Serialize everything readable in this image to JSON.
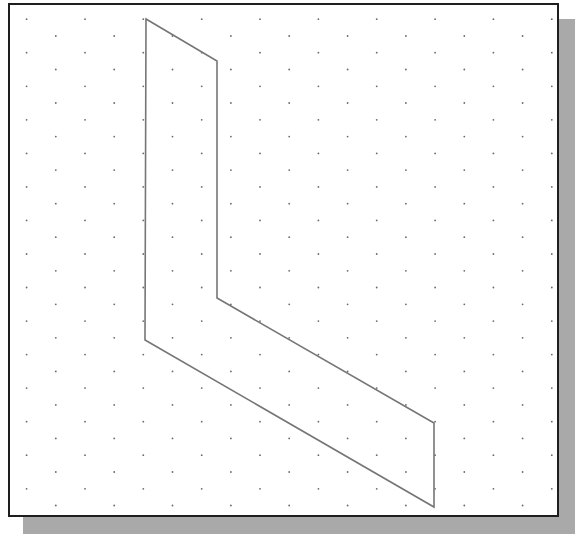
{
  "canvas": {
    "width": 585,
    "height": 544,
    "background": "#ffffff"
  },
  "frame": {
    "x": 8,
    "y": 3,
    "width": 551,
    "height": 514,
    "border_width": 2,
    "border_color": "#1e1e1e",
    "fill": "#ffffff"
  },
  "shadow": {
    "x": 23,
    "y": 19,
    "width": 552,
    "height": 515,
    "color": "#a9a9a9"
  },
  "grid": {
    "type": "isometric-dot-grid",
    "dot_color": "#6a6a6a",
    "dot_radius": 0.9,
    "row_start_y": 19.2,
    "row_spacing": 16.77,
    "row_count": 30,
    "even_row_start_x": 26.6,
    "odd_row_start_x": 55.8,
    "column_spacing": 58.35,
    "even_row_count": 10,
    "odd_row_count": 9
  },
  "shape": {
    "name": "L-shaped isometric polygon",
    "stroke": "#767676",
    "stroke_width": 1.6,
    "fill": "none",
    "vertices": [
      [
        146,
        19
      ],
      [
        217,
        61
      ],
      [
        217,
        298
      ],
      [
        434,
        423
      ],
      [
        434,
        507
      ],
      [
        145,
        340
      ]
    ]
  }
}
